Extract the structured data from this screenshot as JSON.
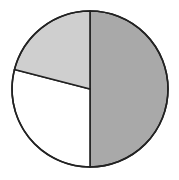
{
  "chart_data": {
    "type": "pie",
    "title": "",
    "categories": [
      "Slice A",
      "Slice B",
      "Slice C"
    ],
    "values": [
      50,
      29,
      21
    ],
    "colors": [
      "#a9a9a9",
      "#ffffff",
      "#cfcfcf"
    ],
    "start_angle_deg": 90,
    "direction": "clockwise-from-top-to-right",
    "legend": "none",
    "labels_shown": false
  },
  "style": {
    "stroke": "#222222",
    "stroke_width": 1.6,
    "cx": 90,
    "cy": 89,
    "r": 78
  }
}
